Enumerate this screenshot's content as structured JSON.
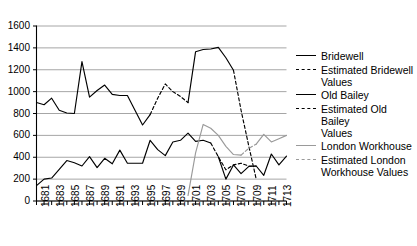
{
  "chart_data": {
    "type": "line",
    "title": "",
    "xlabel": "",
    "ylabel": "",
    "xlim": [
      1681,
      1714
    ],
    "ylim": [
      0,
      1600
    ],
    "ytick_step": 200,
    "xtick_step": 1,
    "xlabel_step": 2,
    "grid": "horizontal",
    "legend_position": "right",
    "ytick_labels": [
      "0",
      "200",
      "400",
      "600",
      "800",
      "1000",
      "1200",
      "1400",
      "1600"
    ],
    "xtick_labels": [
      "1681",
      "1683",
      "1685",
      "1687",
      "1689",
      "1691",
      "1693",
      "1695",
      "1697",
      "1699",
      "1701",
      "1703",
      "1705",
      "1707",
      "1709",
      "1711",
      "1713"
    ],
    "x": [
      1681,
      1682,
      1683,
      1684,
      1685,
      1686,
      1687,
      1688,
      1689,
      1690,
      1691,
      1692,
      1693,
      1694,
      1695,
      1696,
      1697,
      1698,
      1699,
      1700,
      1701,
      1702,
      1703,
      1704,
      1705,
      1706,
      1707,
      1708,
      1709,
      1710,
      1711,
      1712,
      1713,
      1714
    ],
    "series": [
      {
        "name": "Bridewell",
        "color": "#000000",
        "style": "solid",
        "points": [
          [
            1681,
            900
          ],
          [
            1682,
            880
          ],
          [
            1683,
            940
          ],
          [
            1684,
            830
          ],
          [
            1685,
            805
          ],
          [
            1686,
            800
          ],
          [
            1687,
            1275
          ],
          [
            1688,
            950
          ],
          [
            1689,
            1010
          ],
          [
            1690,
            1060
          ],
          [
            1691,
            975
          ],
          [
            1692,
            965
          ],
          [
            1693,
            965
          ],
          [
            1694,
            830
          ],
          [
            1695,
            695
          ],
          [
            1696,
            790
          ]
        ]
      },
      {
        "name": "Estimated Bridewell Values",
        "color": "#000000",
        "style": "dashed",
        "points": [
          [
            1696,
            790
          ],
          [
            1697,
            940
          ],
          [
            1698,
            1070
          ],
          [
            1699,
            1000
          ],
          [
            1700,
            955
          ],
          [
            1701,
            900
          ]
        ]
      },
      {
        "name": "Bridewell",
        "color": "#000000",
        "style": "solid",
        "points": [
          [
            1701,
            900
          ],
          [
            1702,
            1365
          ],
          [
            1703,
            1385
          ],
          [
            1704,
            1390
          ],
          [
            1705,
            1405
          ],
          [
            1706,
            1310
          ],
          [
            1707,
            1195
          ]
        ]
      },
      {
        "name": "Estimated Bridewell Values",
        "color": "#000000",
        "style": "dashed",
        "points": [
          [
            1707,
            1195
          ],
          [
            1708,
            830
          ],
          [
            1709,
            510
          ],
          [
            1710,
            200
          ]
        ]
      },
      {
        "name": "Old Bailey",
        "color": "#000000",
        "style": "solid",
        "points": [
          [
            1681,
            140
          ],
          [
            1682,
            200
          ],
          [
            1683,
            210
          ],
          [
            1684,
            290
          ],
          [
            1685,
            370
          ],
          [
            1686,
            350
          ],
          [
            1687,
            320
          ],
          [
            1688,
            405
          ],
          [
            1689,
            305
          ],
          [
            1690,
            390
          ],
          [
            1691,
            340
          ],
          [
            1692,
            465
          ],
          [
            1693,
            345
          ],
          [
            1694,
            345
          ],
          [
            1695,
            345
          ],
          [
            1696,
            555
          ],
          [
            1697,
            470
          ],
          [
            1698,
            415
          ],
          [
            1699,
            540
          ],
          [
            1700,
            555
          ],
          [
            1701,
            620
          ],
          [
            1702,
            545
          ],
          [
            1703,
            555
          ],
          [
            1704,
            530
          ]
        ]
      },
      {
        "name": "Estimated Old Bailey Values",
        "color": "#000000",
        "style": "dashed",
        "points": [
          [
            1704,
            530
          ],
          [
            1705,
            405
          ],
          [
            1706,
            285
          ],
          [
            1707,
            330
          ],
          [
            1708,
            345
          ],
          [
            1709,
            320
          ],
          [
            1710,
            320
          ]
        ]
      },
      {
        "name": "Old Bailey",
        "color": "#000000",
        "style": "solid",
        "points": [
          [
            1705,
            405
          ],
          [
            1706,
            200
          ],
          [
            1707,
            330
          ],
          [
            1708,
            250
          ],
          [
            1709,
            315
          ],
          [
            1710,
            320
          ],
          [
            1711,
            235
          ],
          [
            1712,
            430
          ],
          [
            1713,
            330
          ],
          [
            1714,
            410
          ]
        ]
      },
      {
        "name": "London Workhouse",
        "color": "#9a9a9a",
        "style": "solid",
        "points": [
          [
            1701,
            50
          ],
          [
            1702,
            440
          ],
          [
            1703,
            700
          ],
          [
            1704,
            665
          ],
          [
            1705,
            600
          ],
          [
            1706,
            500
          ],
          [
            1707,
            425
          ],
          [
            1708,
            420
          ]
        ]
      },
      {
        "name": "Estimated London Workhouse Values",
        "color": "#9a9a9a",
        "style": "dashed",
        "points": [
          [
            1708,
            420
          ],
          [
            1709,
            480
          ],
          [
            1710,
            520
          ]
        ]
      },
      {
        "name": "London Workhouse",
        "color": "#9a9a9a",
        "style": "solid",
        "points": [
          [
            1710,
            520
          ],
          [
            1711,
            610
          ],
          [
            1712,
            540
          ],
          [
            1713,
            570
          ],
          [
            1714,
            600
          ]
        ]
      }
    ]
  },
  "legend": {
    "items": [
      {
        "label": "Bridewell",
        "style": "lg-solid-black"
      },
      {
        "label": "Estimated Bridewell\nValues",
        "style": "lg-dash-black"
      },
      {
        "label": "Old Bailey",
        "style": "lg-solid-black"
      },
      {
        "label": "Estimated Old Bailey\nValues",
        "style": "lg-dash-black"
      },
      {
        "label": "London Workhouse",
        "style": "lg-solid-gray"
      },
      {
        "label": "Estimated London\nWorkhouse Values",
        "style": "lg-dash-gray"
      }
    ]
  },
  "colors": {
    "axis": "#000000",
    "gridline": "#a6a6a6",
    "series_primary": "#000000",
    "series_workhouse": "#9a9a9a",
    "background": "#ffffff"
  }
}
